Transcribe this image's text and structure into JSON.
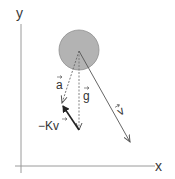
{
  "diagram": {
    "type": "free-body / vector diagram",
    "axes": {
      "x_label": "x",
      "y_label": "y"
    },
    "body": {
      "shape": "circle",
      "fill": "#b3b3b3",
      "stroke": "#8f8f8f"
    },
    "vectors": [
      {
        "id": "a",
        "label": "a",
        "style": "dashed",
        "description": "acceleration"
      },
      {
        "id": "g",
        "label": "g",
        "style": "dashed",
        "description": "gravitational acceleration"
      },
      {
        "id": "v",
        "label": "v",
        "style": "solid",
        "description": "velocity"
      },
      {
        "id": "drag",
        "label": "−Kv",
        "style": "solid-bold",
        "description": "drag term"
      }
    ],
    "colors": {
      "axis": "#9a9a9a",
      "vector": "#555555",
      "drag_vector": "#222222"
    }
  }
}
